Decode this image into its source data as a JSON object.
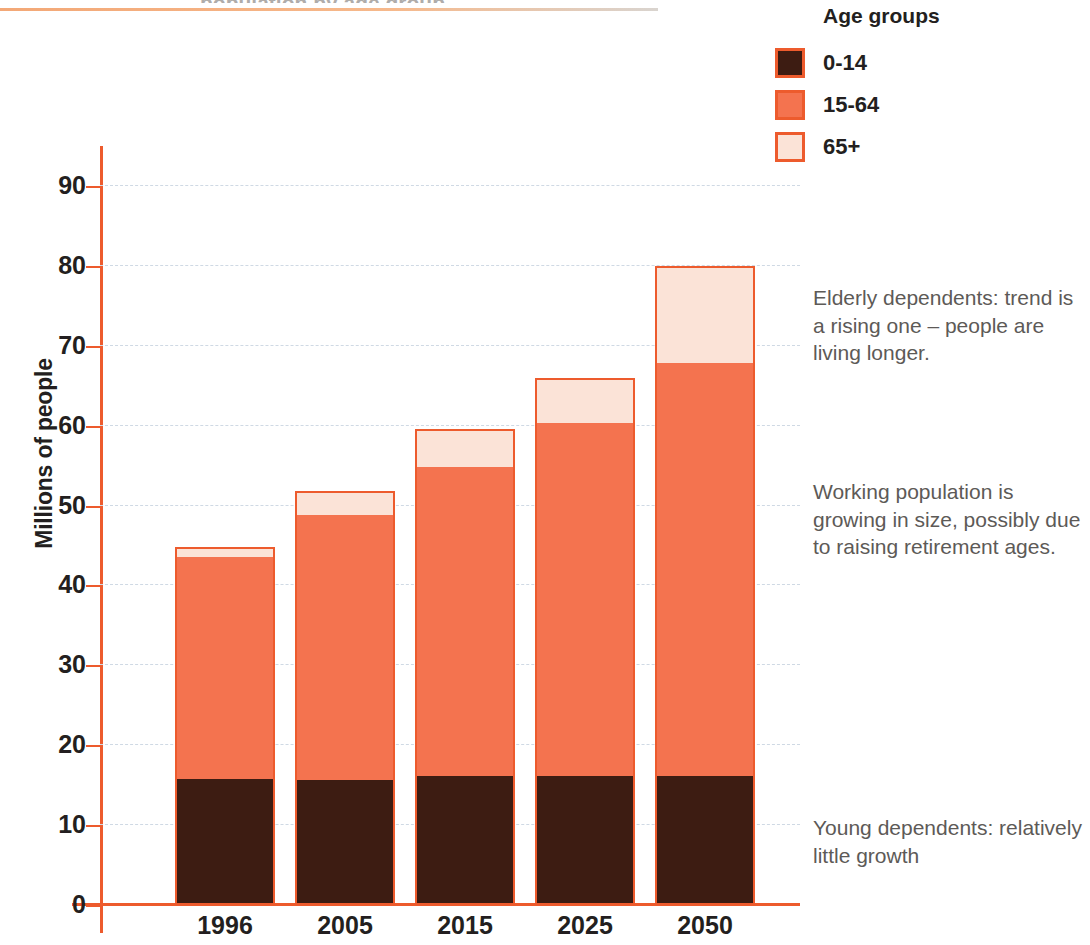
{
  "page": {
    "clipped_header_text": "population by age group"
  },
  "chart_data": {
    "type": "bar",
    "stacked": true,
    "title": "",
    "subtitle": "",
    "xlabel": "",
    "ylabel": "Millions of people",
    "ylim": [
      0,
      95
    ],
    "ytick_step": 10,
    "yticks": [
      0,
      10,
      20,
      30,
      40,
      50,
      60,
      70,
      80,
      90
    ],
    "grid": true,
    "legend_position": "top-right",
    "categories": [
      "1996",
      "2005",
      "2015",
      "2025",
      "2050"
    ],
    "series": [
      {
        "name": "0-14",
        "color": "#3d1c12",
        "values": [
          15.8,
          15.6,
          16.1,
          16.1,
          16.1
        ]
      },
      {
        "name": "15-64",
        "color": "#f4734f",
        "values": [
          27.7,
          33.2,
          38.7,
          44.2,
          51.7
        ]
      },
      {
        "name": "65+",
        "color": "#fbe3d7",
        "values": [
          1.3,
          3.0,
          4.8,
          5.7,
          12.2
        ]
      }
    ],
    "totals": [
      44.8,
      51.8,
      59.6,
      66.0,
      80.0
    ]
  },
  "axis": {
    "y_title": "Millions of people",
    "y_ticks": [
      "0",
      "10",
      "20",
      "30",
      "40",
      "50",
      "60",
      "70",
      "80",
      "90"
    ],
    "x_ticks": [
      "1996",
      "2005",
      "2015",
      "2025",
      "2050"
    ]
  },
  "legend": {
    "title": "Age groups",
    "items": [
      {
        "label": "0-14",
        "color": "#3d1c12"
      },
      {
        "label": "15-64",
        "color": "#f4734f"
      },
      {
        "label": "65+",
        "color": "#fbe3d7"
      }
    ]
  },
  "annotations": {
    "elderly": "Elderly dependents: trend is a rising one – people are living longer.",
    "working": "Working population is growing in size, possibly due to raising retirement ages.",
    "young": "Young dependents: relatively little growth"
  },
  "colors": {
    "accent": "#ed5b2d",
    "young": "#3d1c12",
    "working": "#f4734f",
    "elderly": "#fbe3d7",
    "gridline": "#cfd9e4",
    "annotation_text": "#5d5a57"
  }
}
